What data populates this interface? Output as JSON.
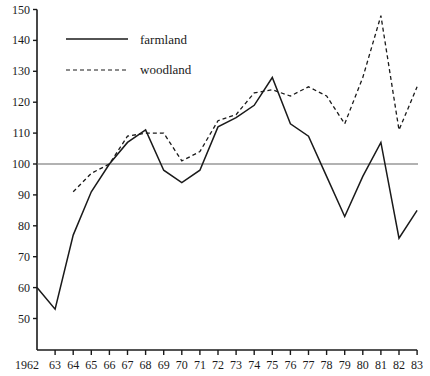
{
  "chart_data": {
    "type": "line",
    "title": "",
    "xlabel": "",
    "ylabel": "",
    "ylim": [
      40,
      150
    ],
    "yticks": [
      50,
      60,
      70,
      80,
      90,
      100,
      110,
      120,
      130,
      140,
      150
    ],
    "x": [
      1962,
      1963,
      1964,
      1965,
      1966,
      1967,
      1968,
      1969,
      1970,
      1971,
      1972,
      1973,
      1974,
      1975,
      1976,
      1977,
      1978,
      1979,
      1980,
      1981,
      1982,
      1983
    ],
    "xtick_labels": [
      "1962",
      "63",
      "64",
      "65",
      "66",
      "67",
      "68",
      "69",
      "70",
      "71",
      "72",
      "73",
      "74",
      "75",
      "76",
      "77",
      "78",
      "79",
      "80",
      "81",
      "82",
      "83"
    ],
    "reference_line": 100,
    "grid": false,
    "legend_position": "upper-left",
    "series": [
      {
        "name": "farmland",
        "style": "solid",
        "values": [
          60,
          53,
          77,
          91,
          100,
          107,
          111,
          98,
          94,
          98,
          112,
          115,
          119,
          128,
          113,
          109,
          96,
          83,
          96,
          107,
          76,
          85
        ]
      },
      {
        "name": "woodland",
        "style": "dashed",
        "values": [
          null,
          null,
          91,
          97,
          100,
          109,
          110,
          110,
          101,
          104,
          114,
          116,
          123,
          124,
          122,
          125,
          122,
          113,
          128,
          148,
          111,
          125
        ]
      }
    ]
  },
  "legend": {
    "items": [
      {
        "label": "farmland",
        "style": "solid"
      },
      {
        "label": "woodland",
        "style": "dashed"
      }
    ]
  },
  "colors": {
    "line": "#1a1a1a",
    "reference": "#666666",
    "axis": "#1a1a1a"
  }
}
